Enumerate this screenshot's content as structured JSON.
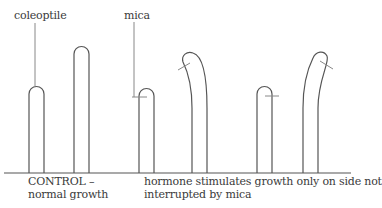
{
  "labels": {
    "coleoptile": "coleoptile",
    "mica": "mica",
    "control_line1": "CONTROL –",
    "control_line2": "normal growth",
    "caption_line1": "hormone stimulates growth only on side not",
    "caption_line2": "interrupted by mica"
  },
  "colors": {
    "stroke": "#555555",
    "mica_mark": "#888888",
    "text": "#3a3a3a"
  },
  "diagram": {
    "groups": [
      {
        "name": "control",
        "shoots": [
          "short-straight",
          "tall-straight"
        ]
      },
      {
        "name": "mica-left",
        "shoots": [
          "short-with-mica-left",
          "tall-bent-right-with-mica"
        ]
      },
      {
        "name": "mica-right",
        "shoots": [
          "short-with-mica-right",
          "tall-bent-right-with-mica"
        ]
      }
    ]
  }
}
